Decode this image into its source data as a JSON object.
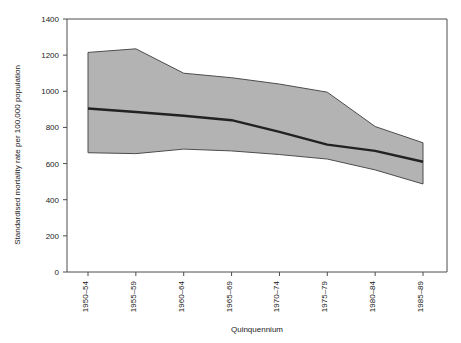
{
  "chart_data": {
    "type": "area",
    "title": "",
    "xlabel": "Quinquennium",
    "ylabel": "Standardised mortality rate per 100,000 population",
    "categories": [
      "1950–54",
      "1955–59",
      "1960–64",
      "1965–69",
      "1970–74",
      "1975–79",
      "1980–84",
      "1985–89"
    ],
    "ylim": [
      0,
      1400
    ],
    "yticks": [
      0,
      200,
      400,
      600,
      800,
      1000,
      1200,
      1400
    ],
    "ytick_labels": [
      "0",
      "200",
      "400",
      "600",
      "800",
      "1000",
      "1200",
      "1400"
    ],
    "grid": false,
    "legend": "none",
    "series": [
      {
        "name": "Upper bound",
        "values": [
          1215,
          1235,
          1100,
          1075,
          1040,
          995,
          805,
          715
        ]
      },
      {
        "name": "Median",
        "values": [
          905,
          885,
          865,
          840,
          775,
          705,
          670,
          610
        ]
      },
      {
        "name": "Lower bound",
        "values": [
          660,
          655,
          680,
          670,
          650,
          625,
          565,
          487
        ]
      }
    ],
    "band": {
      "name": "Range between lower and upper bound",
      "fill_color": "#b3b3b3"
    },
    "colors": {
      "band_fill": "#b3b3b3",
      "band_edge": "#4d4d4d",
      "median_line": "#222222",
      "axis": "#4d4d4d",
      "text": "#1a1a1a",
      "background": "#ffffff"
    }
  }
}
